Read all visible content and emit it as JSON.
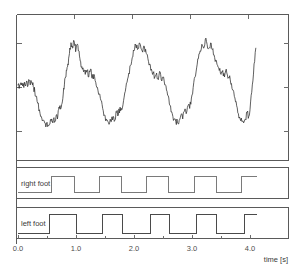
{
  "chart_data": {
    "type": "line",
    "title": "",
    "xlabel": "time [s]",
    "ylabel": "",
    "xlim": [
      -0.03,
      4.15
    ],
    "ylim": [
      0,
      1
    ],
    "grid": false,
    "legend_position": "none",
    "xticks": [
      0.0,
      1.0,
      2.0,
      3.0,
      4.0
    ],
    "xtick_labels": [
      "0.0",
      "1.0",
      "2.0",
      "3.0",
      "4.0"
    ],
    "panels": [
      {
        "name": "acceleration-signal",
        "type": "line",
        "label": "",
        "description": "Noisy quasi-periodic gait signal, about 5 cycles over 4.1 s",
        "series": [
          {
            "name": "signal",
            "color": "#2b2b2b",
            "x": [
              0.0,
              0.03,
              0.06,
              0.09,
              0.12,
              0.15,
              0.17,
              0.19,
              0.21,
              0.23,
              0.25,
              0.27,
              0.29,
              0.31,
              0.34,
              0.37,
              0.4,
              0.43,
              0.46,
              0.49,
              0.52,
              0.55,
              0.58,
              0.6,
              0.62,
              0.64,
              0.66,
              0.68,
              0.7,
              0.72,
              0.74,
              0.76,
              0.78,
              0.8,
              0.82,
              0.84,
              0.86,
              0.88,
              0.9,
              0.92,
              0.94,
              0.96,
              0.98,
              1.0,
              1.02,
              1.04,
              1.06,
              1.08,
              1.1,
              1.13,
              1.16,
              1.19,
              1.22,
              1.25,
              1.28,
              1.31,
              1.34,
              1.37,
              1.4,
              1.43,
              1.46,
              1.49,
              1.52,
              1.55,
              1.58,
              1.61,
              1.64,
              1.67,
              1.7,
              1.73,
              1.76,
              1.79,
              1.82,
              1.85,
              1.88,
              1.91,
              1.94,
              1.97,
              2.0,
              2.03,
              2.06,
              2.09,
              2.12,
              2.15,
              2.18,
              2.21,
              2.24,
              2.27,
              2.3,
              2.33,
              2.36,
              2.39,
              2.42,
              2.45,
              2.48,
              2.51,
              2.54,
              2.57,
              2.6,
              2.63,
              2.66,
              2.69,
              2.72,
              2.75,
              2.78,
              2.81,
              2.84,
              2.87,
              2.9,
              2.93,
              2.96,
              2.99,
              3.02,
              3.05,
              3.08,
              3.11,
              3.14,
              3.17,
              3.2,
              3.23,
              3.26,
              3.29,
              3.32,
              3.35,
              3.38,
              3.41,
              3.44,
              3.47,
              3.5,
              3.53,
              3.56,
              3.59,
              3.62,
              3.65,
              3.68,
              3.71,
              3.74,
              3.77,
              3.8,
              3.83,
              3.86,
              3.89,
              3.92,
              3.95,
              3.98,
              4.01,
              4.04,
              4.07,
              4.1
            ],
            "y": [
              0.52,
              0.52,
              0.52,
              0.53,
              0.52,
              0.55,
              0.51,
              0.56,
              0.52,
              0.54,
              0.52,
              0.5,
              0.47,
              0.43,
              0.38,
              0.33,
              0.28,
              0.25,
              0.23,
              0.22,
              0.21,
              0.22,
              0.26,
              0.23,
              0.27,
              0.24,
              0.29,
              0.26,
              0.33,
              0.36,
              0.34,
              0.38,
              0.45,
              0.52,
              0.58,
              0.63,
              0.68,
              0.74,
              0.79,
              0.83,
              0.8,
              0.86,
              0.82,
              0.79,
              0.83,
              0.78,
              0.74,
              0.7,
              0.66,
              0.62,
              0.6,
              0.63,
              0.58,
              0.64,
              0.57,
              0.6,
              0.54,
              0.5,
              0.45,
              0.4,
              0.34,
              0.29,
              0.26,
              0.24,
              0.23,
              0.24,
              0.28,
              0.25,
              0.31,
              0.29,
              0.35,
              0.33,
              0.4,
              0.47,
              0.54,
              0.61,
              0.67,
              0.73,
              0.78,
              0.82,
              0.79,
              0.84,
              0.8,
              0.77,
              0.81,
              0.76,
              0.72,
              0.68,
              0.64,
              0.61,
              0.58,
              0.61,
              0.56,
              0.62,
              0.55,
              0.58,
              0.52,
              0.47,
              0.42,
              0.36,
              0.3,
              0.26,
              0.24,
              0.23,
              0.25,
              0.29,
              0.26,
              0.32,
              0.3,
              0.36,
              0.34,
              0.42,
              0.5,
              0.58,
              0.65,
              0.72,
              0.78,
              0.83,
              0.8,
              0.87,
              0.83,
              0.8,
              0.84,
              0.79,
              0.75,
              0.71,
              0.67,
              0.63,
              0.6,
              0.63,
              0.58,
              0.64,
              0.57,
              0.59,
              0.53,
              0.48,
              0.42,
              0.36,
              0.3,
              0.26,
              0.24,
              0.23,
              0.26,
              0.31,
              0.28,
              0.39,
              0.52,
              0.68,
              0.8
            ]
          }
        ]
      },
      {
        "name": "right-foot-channel",
        "type": "square",
        "label": "right foot",
        "color": "#7a7a7a",
        "description": "Binary right-foot contact pulses",
        "pulses": [
          {
            "start": 0.58,
            "end": 0.97
          },
          {
            "start": 1.4,
            "end": 1.78
          },
          {
            "start": 2.22,
            "end": 2.6
          },
          {
            "start": 3.04,
            "end": 3.42
          },
          {
            "start": 3.86,
            "end": 4.12
          }
        ]
      },
      {
        "name": "left-foot-channel",
        "type": "square",
        "label": "left foot",
        "color": "#4a4a4a",
        "description": "Binary left-foot contact pulses",
        "pulses": [
          {
            "start": 0.55,
            "end": 1.0
          },
          {
            "start": 1.45,
            "end": 1.8
          },
          {
            "start": 2.28,
            "end": 2.62
          },
          {
            "start": 3.08,
            "end": 3.42
          },
          {
            "start": 3.9,
            "end": 4.12
          }
        ]
      }
    ]
  },
  "labels": {
    "right_foot": "right foot",
    "left_foot": "left foot",
    "x_axis_title": "time [s]",
    "tick_0": "0.0",
    "tick_1": "1.0",
    "tick_2": "2.0",
    "tick_3": "3.0",
    "tick_4": "4.0"
  },
  "colors": {
    "signal": "#2b2b2b",
    "right_foot": "#7a7a7a",
    "left_foot": "#4a4a4a",
    "axis": "#5a5a5a",
    "background": "#ffffff"
  }
}
